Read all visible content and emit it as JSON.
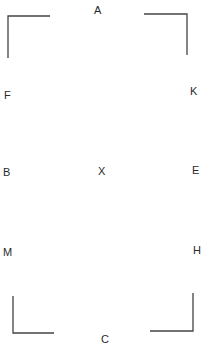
{
  "diagram": {
    "type": "dressage-arena",
    "line_color": "#444444",
    "text_color": "#2a2a2a",
    "markers": [
      {
        "id": "A",
        "label": "A",
        "x": 94,
        "y": 5
      },
      {
        "id": "F",
        "label": "F",
        "x": 4,
        "y": 90
      },
      {
        "id": "K",
        "label": "K",
        "x": 190,
        "y": 86
      },
      {
        "id": "B",
        "label": "B",
        "x": 3,
        "y": 167
      },
      {
        "id": "X",
        "label": "X",
        "x": 98,
        "y": 166
      },
      {
        "id": "E",
        "label": "E",
        "x": 192,
        "y": 165
      },
      {
        "id": "M",
        "label": "M",
        "x": 3,
        "y": 247
      },
      {
        "id": "H",
        "label": "H",
        "x": 193,
        "y": 245
      },
      {
        "id": "C",
        "label": "C",
        "x": 101,
        "y": 334
      }
    ],
    "corners": [
      {
        "id": "top-left",
        "points": "8,58 8,16 50,16"
      },
      {
        "id": "top-right",
        "points": "144,14 187,14 187,55"
      },
      {
        "id": "bottom-left",
        "points": "13,296 13,333 54,333"
      },
      {
        "id": "bottom-right",
        "points": "150,331 193,331 193,293"
      }
    ]
  }
}
